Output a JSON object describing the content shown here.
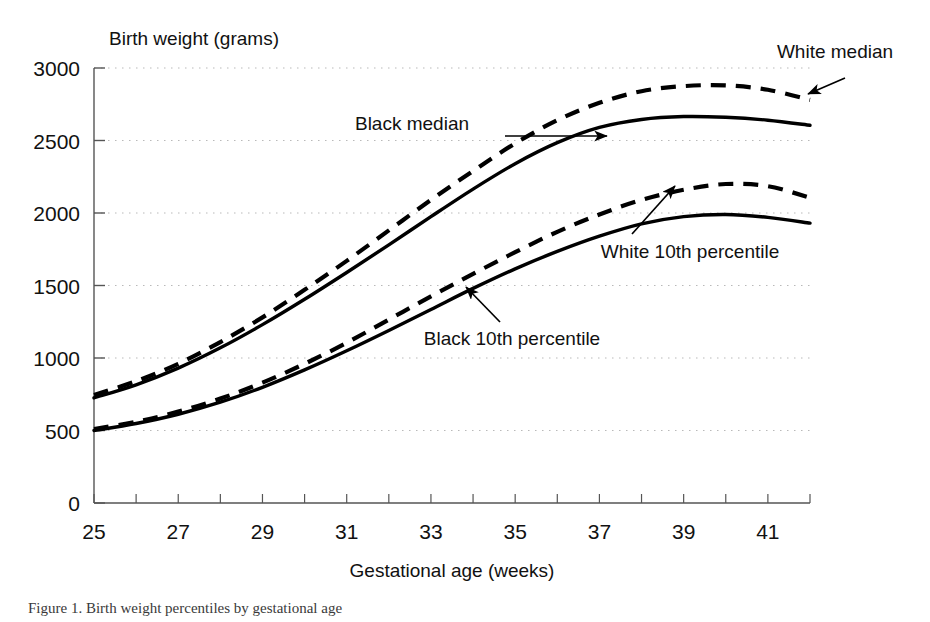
{
  "figure": {
    "caption_fragment": "Figure 1. Birth weight percentiles by gestational age"
  },
  "chart_data": {
    "type": "line",
    "title": "",
    "xlabel": "Gestational age (weeks)",
    "ylabel": "Birth weight (grams)",
    "xlim": [
      25,
      42
    ],
    "ylim": [
      0,
      3000
    ],
    "grid": true,
    "grid_axis": "y",
    "legend_position": "inline-annotations",
    "x_ticks_all": [
      25,
      26,
      27,
      28,
      29,
      30,
      31,
      32,
      33,
      34,
      35,
      36,
      37,
      38,
      39,
      40,
      41,
      42
    ],
    "x_tick_labels": [
      "25",
      "27",
      "29",
      "31",
      "33",
      "35",
      "37",
      "39",
      "41"
    ],
    "x_tick_label_values": [
      25,
      27,
      29,
      31,
      33,
      35,
      37,
      39,
      41
    ],
    "y_ticks": [
      0,
      500,
      1000,
      1500,
      2000,
      2500,
      3000
    ],
    "y_tick_labels": [
      "0",
      "500",
      "1000",
      "1500",
      "2000",
      "2500",
      "3000"
    ],
    "x": [
      25,
      26,
      27,
      28,
      29,
      30,
      31,
      32,
      33,
      34,
      35,
      36,
      37,
      38,
      39,
      40,
      41,
      42
    ],
    "series": [
      {
        "name": "White median",
        "style": "dashed",
        "values": [
          745,
          840,
          960,
          1110,
          1280,
          1470,
          1670,
          1880,
          2090,
          2290,
          2480,
          2640,
          2760,
          2840,
          2875,
          2880,
          2850,
          2780
        ]
      },
      {
        "name": "Black median",
        "style": "solid",
        "values": [
          725,
          815,
          930,
          1070,
          1230,
          1405,
          1590,
          1780,
          1975,
          2165,
          2340,
          2485,
          2590,
          2645,
          2665,
          2660,
          2640,
          2605
        ]
      },
      {
        "name": "White 10th percentile",
        "style": "dashed",
        "values": [
          510,
          560,
          630,
          720,
          830,
          960,
          1105,
          1265,
          1425,
          1580,
          1730,
          1870,
          1990,
          2090,
          2160,
          2200,
          2185,
          2105
        ]
      },
      {
        "name": "Black 10th percentile",
        "style": "solid",
        "values": [
          500,
          548,
          612,
          695,
          798,
          918,
          1050,
          1190,
          1335,
          1480,
          1615,
          1735,
          1840,
          1925,
          1975,
          1990,
          1970,
          1930
        ]
      }
    ],
    "annotations": [
      {
        "text": "White median",
        "label_x": 835,
        "label_y": 58,
        "arrow_from_x": 845,
        "arrow_from_y": 78,
        "arrow_to_x": 808,
        "arrow_to_y": 94
      },
      {
        "text": "Black median",
        "label_x": 412,
        "label_y": 130,
        "arrow_from_x": 505,
        "arrow_from_y": 136,
        "arrow_to_x": 607,
        "arrow_to_y": 136
      },
      {
        "text": "White 10th percentile",
        "label_x": 690,
        "label_y": 258,
        "arrow_from_x": 632,
        "arrow_from_y": 234,
        "arrow_to_x": 675,
        "arrow_to_y": 186
      },
      {
        "text": "Black 10th percentile",
        "label_x": 512,
        "label_y": 345,
        "arrow_from_x": 500,
        "arrow_from_y": 322,
        "arrow_to_x": 466,
        "arrow_to_y": 287
      }
    ]
  }
}
